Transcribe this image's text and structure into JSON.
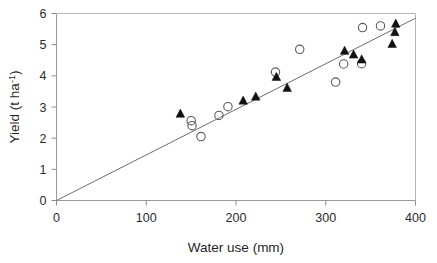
{
  "chart_data": {
    "type": "scatter",
    "title": "",
    "xlabel": "Water use (mm)",
    "ylabel_main": "Yield (t ha",
    "ylabel_sup": "-1",
    "ylabel_close": ")",
    "ylabel_full": "Yield (t ha-1)",
    "xlim": [
      0,
      400
    ],
    "ylim": [
      0,
      6
    ],
    "xticks": [
      0,
      100,
      200,
      300,
      400
    ],
    "xtick_labels": [
      "0",
      "100",
      "200",
      "300",
      "400"
    ],
    "yticks": [
      0,
      1,
      2,
      3,
      4,
      5,
      6
    ],
    "ytick_labels": [
      "0",
      "1",
      "2",
      "3",
      "4",
      "5",
      "6"
    ],
    "grid": false,
    "legend": "none",
    "series": [
      {
        "name": "open-circles",
        "marker": "open-circle",
        "color": "#5b5b5b",
        "points": [
          [
            150,
            2.56
          ],
          [
            151,
            2.4
          ],
          [
            161,
            2.05
          ],
          [
            181,
            2.73
          ],
          [
            191,
            3.01
          ],
          [
            244,
            4.12
          ],
          [
            271,
            4.85
          ],
          [
            311,
            3.8
          ],
          [
            320,
            4.38
          ],
          [
            340,
            4.39
          ],
          [
            341,
            5.55
          ],
          [
            361,
            5.6
          ]
        ]
      },
      {
        "name": "filled-triangles",
        "marker": "filled-triangle",
        "color": "#111111",
        "points": [
          [
            138,
            2.78
          ],
          [
            208,
            3.2
          ],
          [
            222,
            3.33
          ],
          [
            245,
            3.96
          ],
          [
            257,
            3.61
          ],
          [
            321,
            4.8
          ],
          [
            331,
            4.68
          ],
          [
            340,
            4.52
          ],
          [
            374,
            5.02
          ],
          [
            377,
            5.4
          ],
          [
            378,
            5.67
          ]
        ]
      }
    ],
    "trendline": {
      "name": "linear-fit",
      "x_start": 0,
      "y_start": 0.0,
      "x_end": 400,
      "y_end": 5.85,
      "color": "#6d6d6d"
    }
  },
  "axes": {
    "x_axis_name": "water-use-axis",
    "y_axis_name": "yield-axis"
  }
}
